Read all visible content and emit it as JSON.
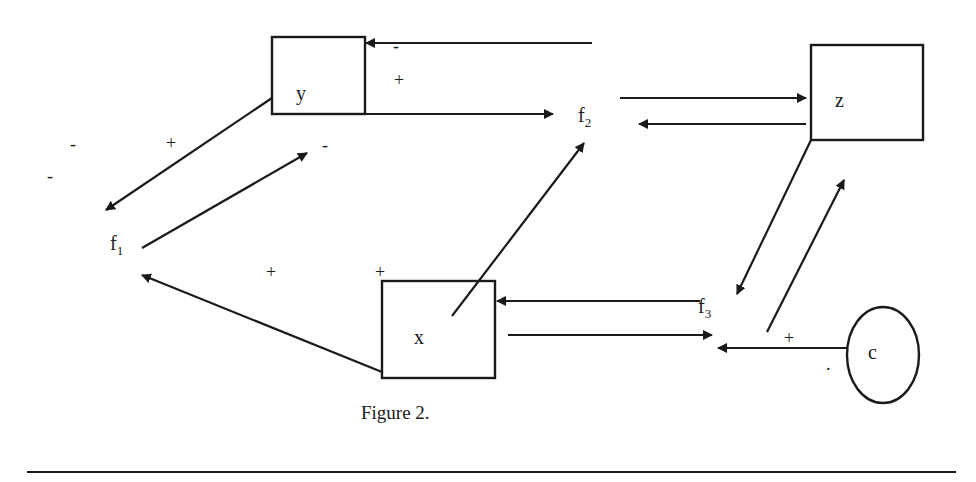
{
  "diagram": {
    "nodes": {
      "y": {
        "label": "y",
        "shape": "rectangle"
      },
      "z": {
        "label": "z",
        "shape": "rectangle"
      },
      "x": {
        "label": "x",
        "shape": "rectangle"
      },
      "c": {
        "label": "c",
        "shape": "ellipse"
      },
      "f1": {
        "label": "f",
        "sub": "1"
      },
      "f2": {
        "label": "f",
        "sub": "2"
      },
      "f3": {
        "label": "f",
        "sub": "3"
      }
    },
    "signs": {
      "y_top_minus": "-",
      "y_top_plus": "+",
      "f1_left_minus_1": "-",
      "f1_left_minus_2": "-",
      "f1_y_plus": "+",
      "f1_y_minus": "-",
      "x_f1_plus_1": "+",
      "x_f1_plus_2": "+",
      "c_plus": "+",
      "c_dot": "."
    },
    "edges": [
      {
        "from": "f2",
        "to": "y",
        "sign": "-"
      },
      {
        "from": "y",
        "to": "f2",
        "sign": "+"
      },
      {
        "from": "f2",
        "to": "z"
      },
      {
        "from": "z",
        "to": "f2"
      },
      {
        "from": "y",
        "to": "f1"
      },
      {
        "from": "f1",
        "to": "y"
      },
      {
        "from": "x",
        "to": "f1"
      },
      {
        "from": "x",
        "to": "f2"
      },
      {
        "from": "f3",
        "to": "x"
      },
      {
        "from": "x",
        "to": "f3"
      },
      {
        "from": "z",
        "to": "f3"
      },
      {
        "from": "f3",
        "to": "z"
      },
      {
        "from": "c",
        "to": "f3",
        "sign": "+"
      }
    ],
    "caption": "Figure 2."
  }
}
